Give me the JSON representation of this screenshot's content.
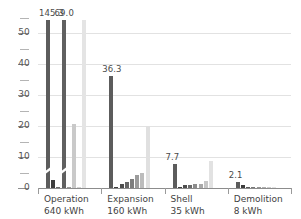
{
  "chart_data": {
    "type": "bar",
    "title": "",
    "subtitle": "",
    "xlabel": "",
    "ylabel": "",
    "ylim": [
      0,
      55
    ],
    "grid": true,
    "legend": "none",
    "y_ticks_major": [
      0,
      10,
      20,
      30,
      40,
      50
    ],
    "y_tick_labels": [
      "0",
      "10",
      "20",
      "30",
      "40",
      "50"
    ],
    "y_ticks_minor": [
      5,
      15,
      25,
      35,
      45,
      55
    ],
    "broken_axis": true,
    "categories": [
      {
        "label": "Operation",
        "sublabel": "640 kWh"
      },
      {
        "label": "Expansion",
        "sublabel": "160 kWh"
      },
      {
        "label": "Shell",
        "sublabel": "35 kWh"
      },
      {
        "label": "Demolition",
        "sublabel": "8 kWh"
      }
    ],
    "groups": [
      {
        "name": "Operation",
        "sublabel": "640 kWh",
        "bars": [
          {
            "value": 145.3,
            "clipped": true,
            "display": 54.5,
            "color": "#5c5c5c",
            "label": "145.3"
          },
          {
            "value": 2.7,
            "clipped": false,
            "display": 2.7,
            "color": "#3d3d3d",
            "label": ""
          },
          {
            "value": 0.4,
            "clipped": false,
            "display": 0.4,
            "color": "#6e6e6e",
            "label": ""
          },
          {
            "value": 69.0,
            "clipped": true,
            "display": 54.5,
            "color": "#606060",
            "label": "69.0"
          },
          {
            "value": 0.3,
            "clipped": false,
            "display": 0.3,
            "color": "#9a9a9a",
            "label": ""
          },
          {
            "value": 20.7,
            "clipped": false,
            "display": 20.7,
            "color": "#c9c9c9",
            "label": ""
          },
          {
            "value": 0.3,
            "clipped": false,
            "display": 0.3,
            "color": "#d4d4d4",
            "label": ""
          },
          {
            "value": 54.5,
            "clipped": false,
            "display": 54.5,
            "color": "#e4e4e4",
            "label": ""
          }
        ]
      },
      {
        "name": "Expansion",
        "sublabel": "160 kWh",
        "bars": [
          {
            "value": 36.3,
            "clipped": false,
            "display": 36.3,
            "color": "#5c5c5c",
            "label": "36.3"
          },
          {
            "value": 0.4,
            "clipped": false,
            "display": 0.4,
            "color": "#3d3d3d",
            "label": ""
          },
          {
            "value": 1.2,
            "clipped": false,
            "display": 1.2,
            "color": "#4d4d4d",
            "label": ""
          },
          {
            "value": 2.0,
            "clipped": false,
            "display": 2.0,
            "color": "#666666",
            "label": ""
          },
          {
            "value": 3.0,
            "clipped": false,
            "display": 3.0,
            "color": "#7e7e7e",
            "label": ""
          },
          {
            "value": 4.2,
            "clipped": false,
            "display": 4.2,
            "color": "#9c9c9c",
            "label": ""
          },
          {
            "value": 4.8,
            "clipped": false,
            "display": 4.8,
            "color": "#bcbcbc",
            "label": ""
          },
          {
            "value": 20.0,
            "clipped": false,
            "display": 20.0,
            "color": "#e0e0e0",
            "label": ""
          }
        ]
      },
      {
        "name": "Shell",
        "sublabel": "35 kWh",
        "bars": [
          {
            "value": 7.7,
            "clipped": false,
            "display": 7.7,
            "color": "#5c5c5c",
            "label": "7.7"
          },
          {
            "value": 0.3,
            "clipped": false,
            "display": 0.3,
            "color": "#3d3d3d",
            "label": ""
          },
          {
            "value": 0.9,
            "clipped": false,
            "display": 0.9,
            "color": "#4d4d4d",
            "label": ""
          },
          {
            "value": 1.0,
            "clipped": false,
            "display": 1.0,
            "color": "#6a6a6a",
            "label": ""
          },
          {
            "value": 1.2,
            "clipped": false,
            "display": 1.2,
            "color": "#8c8c8c",
            "label": ""
          },
          {
            "value": 1.4,
            "clipped": false,
            "display": 1.4,
            "color": "#a8a8a8",
            "label": ""
          },
          {
            "value": 2.3,
            "clipped": false,
            "display": 2.3,
            "color": "#c6c6c6",
            "label": ""
          },
          {
            "value": 8.8,
            "clipped": false,
            "display": 8.8,
            "color": "#e2e2e2",
            "label": ""
          }
        ]
      },
      {
        "name": "Demolition",
        "sublabel": "8 kWh",
        "bars": [
          {
            "value": 2.1,
            "clipped": false,
            "display": 2.1,
            "color": "#5c5c5c",
            "label": "2.1"
          },
          {
            "value": 0.9,
            "clipped": false,
            "display": 0.9,
            "color": "#3d3d3d",
            "label": ""
          },
          {
            "value": 0.1,
            "clipped": false,
            "display": 0.1,
            "color": "#5a5a5a",
            "label": ""
          },
          {
            "value": 0.4,
            "clipped": false,
            "display": 0.4,
            "color": "#787878",
            "label": ""
          },
          {
            "value": 0.1,
            "clipped": false,
            "display": 0.1,
            "color": "#959595",
            "label": ""
          },
          {
            "value": 0.2,
            "clipped": false,
            "display": 0.2,
            "color": "#b0b0b0",
            "label": ""
          },
          {
            "value": 0.1,
            "clipped": false,
            "display": 0.1,
            "color": "#cccccc",
            "label": ""
          },
          {
            "value": 0.2,
            "clipped": false,
            "display": 0.2,
            "color": "#e2e2e2",
            "label": ""
          }
        ]
      }
    ]
  },
  "colors": {
    "grid": "#e2e2e2",
    "axis": "#8c8c8c",
    "tick_text": "#555555",
    "label_text": "#3f3f3f",
    "value_text": "#4a4a4a",
    "background": "#ffffff"
  }
}
